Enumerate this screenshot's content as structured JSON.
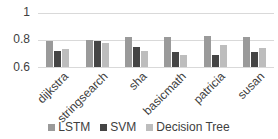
{
  "chart_data": {
    "type": "bar",
    "title": "",
    "xlabel": "",
    "ylabel": "",
    "ylim": [
      0.6,
      1.0
    ],
    "yticks": [
      "0.6",
      "0.8",
      "1"
    ],
    "grid": true,
    "legend_position": "bottom",
    "categories": [
      "dijkstra",
      "stringsearch",
      "sha",
      "basicmath",
      "patricia",
      "susan"
    ],
    "series": [
      {
        "name": "LSTM",
        "color": "#9a9a9a",
        "values": [
          0.79,
          0.8,
          0.82,
          0.82,
          0.83,
          0.82
        ]
      },
      {
        "name": "SVM",
        "color": "#454545",
        "values": [
          0.72,
          0.79,
          0.75,
          0.71,
          0.69,
          0.71
        ]
      },
      {
        "name": "Decision Tree",
        "color": "#bdbdbd",
        "values": [
          0.73,
          0.78,
          0.72,
          0.69,
          0.76,
          0.74
        ]
      }
    ]
  }
}
